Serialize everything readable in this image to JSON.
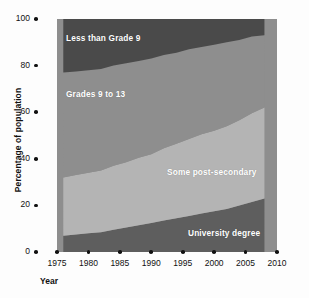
{
  "chart_data": {
    "type": "area",
    "stacked": true,
    "title": "",
    "xlabel": "Year",
    "ylabel": "Percentage of population",
    "xlim": [
      1975,
      2010
    ],
    "ylim": [
      0,
      100
    ],
    "grid": false,
    "legend_position": "inline-labels",
    "x_ticks": [
      "1975",
      "1980",
      "1985",
      "1990",
      "1995",
      "2000",
      "2005",
      "2010"
    ],
    "x_tick_values": [
      1975,
      1980,
      1985,
      1990,
      1995,
      2000,
      2005,
      2010
    ],
    "y_ticks": [
      "0",
      "20",
      "40",
      "60",
      "80",
      "100"
    ],
    "y_tick_values": [
      0,
      20,
      40,
      60,
      80,
      100
    ],
    "x": [
      1976,
      1978,
      1980,
      1982,
      1984,
      1986,
      1988,
      1990,
      1992,
      1994,
      1996,
      1998,
      2000,
      2002,
      2004,
      2006,
      2008
    ],
    "series": [
      {
        "name": "University degree",
        "color": "#5e5e5e",
        "values": [
          7,
          7.5,
          8,
          8.5,
          9.5,
          10.5,
          11.5,
          12.5,
          13.5,
          14.5,
          15.5,
          16.5,
          17.5,
          18.5,
          20,
          21.5,
          23
        ]
      },
      {
        "name": "Some post-secondary",
        "color": "#b4b4b4",
        "values": [
          25,
          25.5,
          26,
          26.5,
          27.5,
          28,
          29,
          29.5,
          31,
          32,
          33,
          34,
          34.5,
          35.5,
          36.5,
          38,
          39
        ]
      },
      {
        "name": "Grades 9 to 13",
        "color": "#8e8e8e",
        "values": [
          45,
          44.5,
          44,
          43.5,
          43,
          42.5,
          41.5,
          41,
          40,
          39,
          38.5,
          37.5,
          37,
          36,
          34.5,
          33,
          31
        ]
      },
      {
        "name": "Less than Grade 9",
        "color": "#4a4a4a",
        "values": [
          23,
          22.5,
          22,
          21.5,
          20,
          19,
          18,
          17,
          15.5,
          14.5,
          13,
          12,
          11,
          10,
          9,
          7.5,
          7
        ]
      }
    ],
    "cumulative_top_boundaries": {
      "university_degree": [
        7,
        7.5,
        8,
        8.5,
        9.5,
        10.5,
        11.5,
        12.5,
        13.5,
        14.5,
        15.5,
        16.5,
        17.5,
        18.5,
        20,
        21.5,
        23
      ],
      "some_post_secondary": [
        32,
        33,
        34,
        35,
        37,
        38.5,
        40.5,
        42,
        44.5,
        46.5,
        48.5,
        50.5,
        52,
        54,
        56.5,
        59.5,
        62
      ],
      "grades_9_to_13": [
        77,
        77.5,
        78,
        78.5,
        80,
        81,
        82,
        83,
        84.5,
        85.5,
        87,
        88,
        89,
        90,
        91,
        92.5,
        93
      ],
      "less_than_grade_9": [
        100,
        100,
        100,
        100,
        100,
        100,
        100,
        100,
        100,
        100,
        100,
        100,
        100,
        100,
        100,
        100,
        100
      ]
    }
  },
  "axes": {
    "ylabel": "Percentage of population",
    "xlabel": "Year"
  },
  "labels": {
    "less_than_grade_9": "Less than Grade 9",
    "grades_9_to_13": "Grades 9 to 13",
    "some_post_secondary": "Some post-secondary",
    "university_degree": "University degree"
  },
  "colors": {
    "less_than_grade_9": "#4a4a4a",
    "grades_9_to_13": "#8e8e8e",
    "some_post_secondary": "#b4b4b4",
    "university_degree": "#5e5e5e",
    "axis": "#111111",
    "background": "#fdfdfd"
  }
}
